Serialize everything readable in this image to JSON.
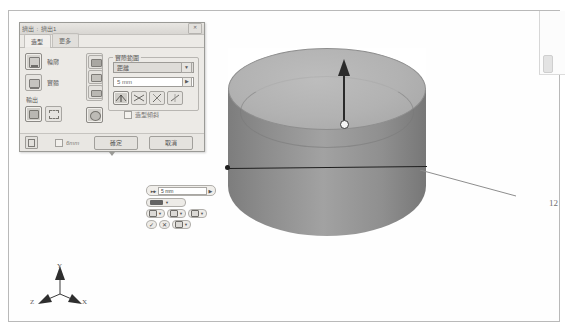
{
  "dialog": {
    "title": "擠出 : 擠出1",
    "close_glyph": "✕",
    "tabs": [
      {
        "label": "造型",
        "active": true
      },
      {
        "label": "更多",
        "active": false
      }
    ],
    "shape_options": [
      {
        "label": "輪廓",
        "icon": "profile-icon",
        "selected": true
      },
      {
        "label": "實體",
        "icon": "solid-icon",
        "selected": false
      }
    ],
    "output": {
      "label": "輸出",
      "buttons": [
        {
          "icon": "solid-output-icon",
          "selected": true
        },
        {
          "icon": "surface-output-icon",
          "selected": false
        }
      ]
    },
    "operation_buttons": [
      {
        "icon": "join-icon"
      },
      {
        "icon": "cut-icon"
      },
      {
        "icon": "intersect-icon"
      }
    ],
    "operation_extra": {
      "icon": "new-solid-icon"
    },
    "extents": {
      "legend": "實際範圍",
      "type_value": "距離",
      "type_arrow": "▼",
      "distance_value": "5 mm",
      "distance_arrow": "▶",
      "direction_buttons": [
        {
          "icon": "direction-1-icon",
          "selected": true
        },
        {
          "icon": "direction-2-icon",
          "selected": false
        },
        {
          "icon": "direction-3-icon",
          "selected": false
        },
        {
          "icon": "direction-4-icon",
          "selected": false
        }
      ]
    },
    "taper": {
      "label": "造型傾斜",
      "checked": false
    },
    "footer": {
      "expand_icon": "more-options-icon",
      "checkbox_label": "6mm",
      "checkbox_checked": false,
      "ok_label": "確定",
      "cancel_label": "取消"
    }
  },
  "minibar": {
    "distance_value": "5 mm",
    "distance_arrow": "▶",
    "grip_glyph": "▸◂▸",
    "operation_caret": "▼",
    "buttons": [
      {
        "icon": "mb-solid-icon",
        "caret": "▼"
      },
      {
        "icon": "mb-surface-icon",
        "caret": "▼"
      },
      {
        "icon": "mb-taper-icon",
        "caret": "▼"
      }
    ],
    "confirm": {
      "icon": "check-icon",
      "glyph": "✓"
    },
    "cancel": {
      "icon": "close-icon",
      "glyph": "✕"
    },
    "options": {
      "icon": "options-icon",
      "caret": "▼"
    }
  },
  "callout": {
    "number": "12"
  },
  "triad": {
    "y_label": "Y",
    "x_label": "X",
    "z_label": "Z"
  },
  "colors": {
    "model_light": "#b2b2b2",
    "model_dark": "#7d7d7d",
    "arrow": "#2b2b2b",
    "dialog_bg": "#eceae6",
    "page_border": "#b9b9b9"
  }
}
